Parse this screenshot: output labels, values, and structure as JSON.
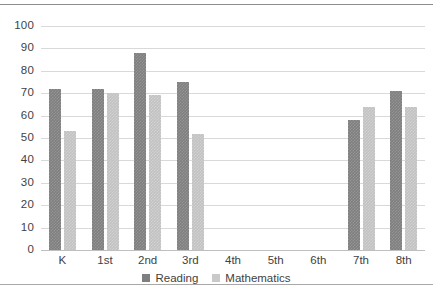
{
  "chart_data": {
    "type": "bar",
    "title": "",
    "xlabel": "",
    "ylabel": "",
    "ylim": [
      0,
      100
    ],
    "ytick_step": 10,
    "grid": true,
    "legend_position": "bottom",
    "categories": [
      "K",
      "1st",
      "2nd",
      "3rd",
      "4th",
      "5th",
      "6th",
      "7th",
      "8th"
    ],
    "series": [
      {
        "name": "Reading",
        "color": "#7f7f7f",
        "values": [
          72,
          72,
          88,
          75,
          null,
          null,
          null,
          58,
          71
        ]
      },
      {
        "name": "Mathematics",
        "color": "#c9c9c9",
        "values": [
          53,
          70,
          69,
          52,
          null,
          null,
          null,
          64,
          64
        ]
      }
    ],
    "yticks": [
      "0",
      "10",
      "20",
      "30",
      "40",
      "50",
      "60",
      "70",
      "80",
      "90",
      "100"
    ],
    "ytick_values": [
      0,
      10,
      20,
      30,
      40,
      50,
      60,
      70,
      80,
      90,
      100
    ]
  },
  "legend": {
    "entries": [
      {
        "label": "Reading"
      },
      {
        "label": "Mathematics"
      }
    ]
  },
  "colors": {
    "reading": "#7f7f7f",
    "mathematics": "#c9c9c9",
    "gridline": "#d9d9d9",
    "text": "#3f3f3f",
    "page_rule": "#8d8d8d"
  }
}
